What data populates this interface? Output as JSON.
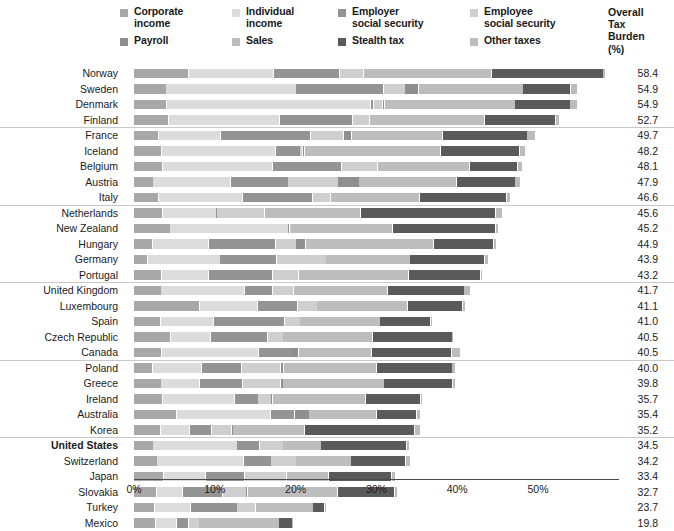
{
  "legend": {
    "columns": [
      [
        {
          "label": "Corporate\nincome",
          "color": "#a8a8a8",
          "key": "corporate_income"
        },
        {
          "label": "Payroll",
          "color": "#8f8f8f",
          "key": "payroll"
        }
      ],
      [
        {
          "label": "Individual\nincome",
          "color": "#dcdcdc",
          "key": "individual_income"
        },
        {
          "label": "Sales",
          "color": "#bdbdbd",
          "key": "sales"
        }
      ],
      [
        {
          "label": "Employer\nsocial security",
          "color": "#949494",
          "key": "employer_social_security"
        },
        {
          "label": "Stealth tax",
          "color": "#5a5a5a",
          "key": "stealth_tax"
        }
      ],
      [
        {
          "label": "Employee\nsocial security",
          "color": "#cfcfcf",
          "key": "employee_social_security"
        },
        {
          "label": "Other taxes",
          "color": "#bcbcbc",
          "key": "other_taxes"
        }
      ]
    ]
  },
  "overall_header": "Overall\nTax\nBurden\n(%)",
  "axis": {
    "ticks": [
      "0%",
      "10%",
      "20%",
      "30%",
      "40%",
      "50%"
    ],
    "tick_values": [
      0,
      10,
      20,
      30,
      40,
      50
    ],
    "min": 0,
    "max": 60
  },
  "group_breaks_after": [
    4,
    9,
    14,
    19,
    24
  ],
  "chart_data": {
    "type": "bar",
    "orientation": "horizontal",
    "stacked": true,
    "title": "",
    "subtitle": "",
    "xlabel": "",
    "ylabel": "",
    "xlim": [
      0,
      60
    ],
    "grid": false,
    "legend_position": "top",
    "value_column_header": "Overall Tax Burden (%)",
    "series": [
      {
        "name": "Corporate income",
        "color": "#a8a8a8",
        "values": [
          6.8,
          4.0,
          4.1,
          4.3,
          3.1,
          3.5,
          3.6,
          2.4,
          3.1,
          3.6,
          4.5,
          2.3,
          1.7,
          3.5,
          3.4,
          8.2,
          3.3,
          4.6,
          3.5,
          2.3,
          3.4,
          3.6,
          5.3,
          3.3,
          2.4,
          2.9,
          3.7,
          2.8,
          2.6,
          2.7
        ]
      },
      {
        "name": "Individual income",
        "color": "#dcdcdc",
        "values": [
          10.5,
          16.1,
          25.2,
          13.8,
          7.7,
          14.1,
          13.6,
          9.6,
          10.4,
          6.6,
          14.6,
          7.0,
          9.0,
          5.8,
          10.3,
          7.1,
          6.6,
          4.9,
          12.0,
          6.1,
          4.8,
          8.9,
          11.6,
          3.6,
          10.4,
          10.7,
          5.2,
          3.3,
          4.4,
          2.6
        ]
      },
      {
        "name": "Employer social security",
        "color": "#949494",
        "values": [
          8.2,
          10.8,
          0.4,
          9.0,
          11.1,
          3.0,
          8.5,
          7.1,
          8.6,
          0.1,
          0.2,
          8.3,
          7.0,
          7.9,
          3.5,
          5.0,
          8.8,
          7.1,
          4.1,
          5.0,
          5.3,
          2.9,
          3.0,
          2.7,
          2.8,
          3.4,
          4.8,
          4.9,
          5.8,
          1.5
        ]
      },
      {
        "name": "Employee social security",
        "color": "#cfcfcf",
        "values": [
          3.0,
          2.7,
          1.1,
          2.1,
          4.1,
          0.3,
          4.5,
          6.2,
          2.3,
          5.9,
          0.1,
          2.5,
          6.1,
          3.2,
          2.6,
          2.4,
          1.9,
          1.9,
          0.0,
          4.8,
          4.7,
          1.6,
          0.0,
          2.5,
          2.9,
          3.1,
          5.2,
          2.9,
          2.3,
          1.3
        ]
      },
      {
        "name": "Payroll",
        "color": "#8f8f8f",
        "values": [
          0.0,
          1.7,
          0.3,
          0.0,
          1.0,
          0.3,
          0.0,
          2.6,
          0.0,
          0.0,
          0.0,
          1.2,
          0.0,
          0.0,
          0.0,
          0.0,
          0.0,
          0.0,
          0.8,
          0.4,
          0.3,
          0.2,
          1.8,
          0.1,
          0.0,
          0.0,
          0.0,
          0.2,
          0.0,
          0.0
        ]
      },
      {
        "name": "Sales",
        "color": "#bdbdbd",
        "values": [
          15.8,
          12.9,
          16.1,
          14.2,
          11.2,
          16.8,
          11.4,
          12.1,
          11.0,
          11.9,
          12.6,
          15.8,
          10.4,
          13.6,
          11.6,
          11.2,
          9.9,
          11.1,
          9.0,
          11.5,
          12.5,
          11.5,
          8.4,
          9.0,
          4.7,
          6.8,
          5.2,
          11.1,
          7.1,
          9.9
        ]
      },
      {
        "name": "Stealth tax",
        "color": "#5a5a5a",
        "values": [
          13.8,
          5.9,
          6.8,
          8.8,
          10.5,
          9.8,
          5.9,
          7.2,
          10.8,
          16.7,
          12.8,
          7.4,
          9.2,
          8.9,
          9.5,
          6.8,
          6.2,
          9.8,
          9.9,
          9.3,
          8.5,
          6.8,
          4.9,
          13.6,
          10.6,
          6.8,
          7.8,
          7.1,
          1.4,
          1.6
        ]
      },
      {
        "name": "Other taxes",
        "color": "#bcbcbc",
        "values": [
          0.3,
          0.8,
          0.9,
          0.5,
          1.0,
          0.7,
          0.6,
          0.7,
          0.4,
          0.8,
          0.4,
          0.4,
          0.5,
          0.3,
          0.8,
          0.4,
          0.3,
          0.1,
          1.2,
          0.4,
          0.3,
          0.2,
          0.5,
          0.7,
          0.3,
          0.5,
          0.5,
          0.4,
          0.1,
          0.2
        ]
      }
    ],
    "rows": [
      {
        "country": "Norway",
        "value": "58.4",
        "total": 58.4,
        "highlight": false
      },
      {
        "country": "Sweden",
        "value": "54.9",
        "total": 54.9,
        "highlight": false
      },
      {
        "country": "Denmark",
        "value": "54.9",
        "total": 54.9,
        "highlight": false
      },
      {
        "country": "Finland",
        "value": "52.7",
        "total": 52.7,
        "highlight": false
      },
      {
        "country": "France",
        "value": "49.7",
        "total": 49.7,
        "highlight": false
      },
      {
        "country": "Iceland",
        "value": "48.2",
        "total": 48.2,
        "highlight": false
      },
      {
        "country": "Belgium",
        "value": "48.1",
        "total": 48.1,
        "highlight": false
      },
      {
        "country": "Austria",
        "value": "47.9",
        "total": 47.9,
        "highlight": false
      },
      {
        "country": "Italy",
        "value": "46.6",
        "total": 46.6,
        "highlight": false
      },
      {
        "country": "Netherlands",
        "value": "45.6",
        "total": 45.6,
        "highlight": false
      },
      {
        "country": "New Zealand",
        "value": "45.2",
        "total": 45.2,
        "highlight": false
      },
      {
        "country": "Hungary",
        "value": "44.9",
        "total": 44.9,
        "highlight": false
      },
      {
        "country": "Germany",
        "value": "43.9",
        "total": 43.9,
        "highlight": false
      },
      {
        "country": "Portugal",
        "value": "43.2",
        "total": 43.2,
        "highlight": false
      },
      {
        "country": "United Kingdom",
        "value": "41.7",
        "total": 41.7,
        "highlight": false
      },
      {
        "country": "Luxembourg",
        "value": "41.1",
        "total": 41.1,
        "highlight": false
      },
      {
        "country": "Spain",
        "value": "41.0",
        "total": 41.0,
        "highlight": false
      },
      {
        "country": "Czech Republic",
        "value": "40.5",
        "total": 40.5,
        "highlight": false
      },
      {
        "country": "Canada",
        "value": "40.5",
        "total": 40.5,
        "highlight": false
      },
      {
        "country": "Poland",
        "value": "40.0",
        "total": 40.0,
        "highlight": false
      },
      {
        "country": "Greece",
        "value": "39.8",
        "total": 39.8,
        "highlight": false
      },
      {
        "country": "Ireland",
        "value": "35.7",
        "total": 35.7,
        "highlight": false
      },
      {
        "country": "Australia",
        "value": "35.4",
        "total": 35.4,
        "highlight": false
      },
      {
        "country": "Korea",
        "value": "35.2",
        "total": 35.2,
        "highlight": false
      },
      {
        "country": "United States",
        "value": "34.5",
        "total": 34.5,
        "highlight": true
      },
      {
        "country": "Switzerland",
        "value": "34.2",
        "total": 34.2,
        "highlight": false
      },
      {
        "country": "Japan",
        "value": "33.4",
        "total": 33.4,
        "highlight": false
      },
      {
        "country": "Slovakia",
        "value": "32.7",
        "total": 32.7,
        "highlight": false
      },
      {
        "country": "Turkey",
        "value": "23.7",
        "total": 23.7,
        "highlight": false
      },
      {
        "country": "Mexico",
        "value": "19.8",
        "total": 19.8,
        "highlight": false
      }
    ]
  }
}
